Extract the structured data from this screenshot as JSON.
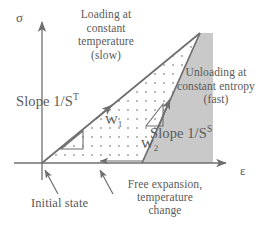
{
  "figure": {
    "axes": {
      "y_label": "σ",
      "x_label": "ε",
      "y_name": "stress",
      "x_name": "strain"
    },
    "annotations": {
      "loading": "Loading at constant temperature (slow)",
      "loading_line1": "Loading at",
      "loading_line2": "constant",
      "loading_line3": "temperature",
      "loading_line4": "(slow)",
      "unloading": "Unloading at constant entropy (fast)",
      "unloading_line1": "Unloading at",
      "unloading_line2": "constant entropy",
      "unloading_line3": "(fast)",
      "slope_loading": "Slope 1/S",
      "slope_loading_sup": "T",
      "slope_unloading": "Slope 1/S",
      "slope_unloading_sup": "S",
      "work1": "W",
      "work1_sub": "1",
      "work2": "W",
      "work2_sub": "2",
      "initial_state": "Initial state",
      "free_expansion_line1": "Free expansion,",
      "free_expansion_line2": "temperature",
      "free_expansion_line3": "change"
    },
    "colors": {
      "line": "#6e6e6e",
      "text": "#5a5a5a",
      "shaded_region": "#c9c9c9",
      "dotted_region": "#b5b5b5",
      "background": "#ffffff"
    },
    "geometry": {
      "origin_x": 42,
      "origin_y": 163,
      "apex_x": 200,
      "apex_y": 33,
      "unload_base_x": 142,
      "shade_right_x": 213,
      "y_axis_top_y": 18,
      "x_axis_right_x": 230
    }
  }
}
